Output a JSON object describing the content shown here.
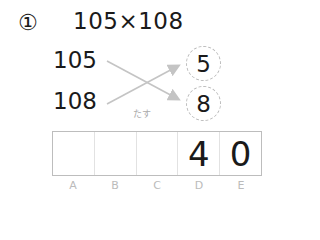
{
  "problem": {
    "number_symbol": "①",
    "expression": "105×108"
  },
  "factors": {
    "top": "105",
    "bottom": "108"
  },
  "circles": {
    "top": "5",
    "bottom": "8"
  },
  "operation_label": "たす",
  "answer_grid": {
    "cells": [
      "",
      "",
      "",
      "4",
      "0"
    ],
    "column_labels": [
      "A",
      "B",
      "C",
      "D",
      "E"
    ]
  },
  "colors": {
    "arrow": "#c4c4c4",
    "grid_border": "#bdbdbd",
    "label": "#bbbbbb"
  }
}
